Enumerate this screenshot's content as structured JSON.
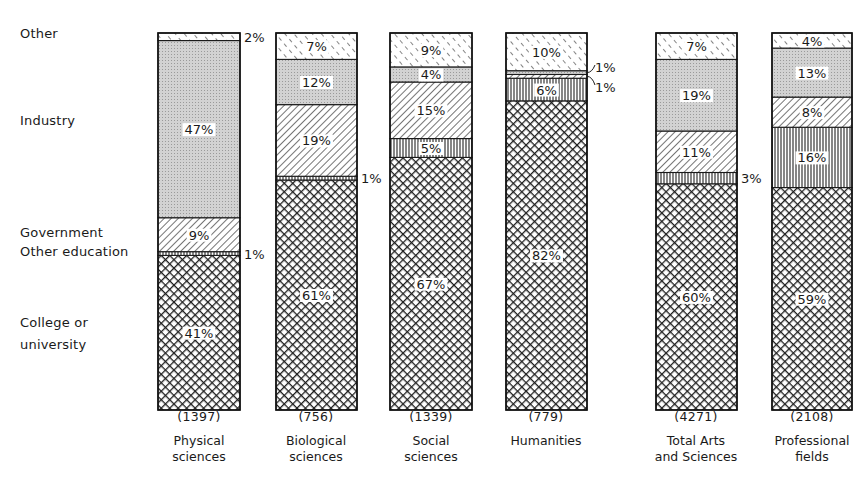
{
  "chart_data": {
    "type": "bar",
    "stacked": true,
    "orientation": "vertical",
    "title": "",
    "xlabel": "",
    "ylabel": "",
    "unit": "%",
    "ylim": [
      0,
      100
    ],
    "grid": false,
    "legend_position": "left (row labels aligned to segments of first bar)",
    "categories": [
      "Physical sciences",
      "Biological sciences",
      "Social sciences",
      "Humanities",
      "Total Arts and Sciences",
      "Professional fields"
    ],
    "sample_sizes": [
      1397,
      756,
      1339,
      779,
      4271,
      2108
    ],
    "series": [
      {
        "name": "College or university",
        "pattern": "crosshatch",
        "values": [
          41,
          61,
          67,
          82,
          60,
          59
        ]
      },
      {
        "name": "Other education",
        "pattern": "vertical-lines",
        "values": [
          1,
          1,
          5,
          6,
          3,
          16
        ]
      },
      {
        "name": "Government",
        "pattern": "diagonal-lines",
        "values": [
          9,
          19,
          15,
          1,
          11,
          8
        ]
      },
      {
        "name": "Industry",
        "pattern": "stipple",
        "values": [
          47,
          12,
          4,
          1,
          19,
          13
        ]
      },
      {
        "name": "Other",
        "pattern": "dashed-diagonal",
        "values": [
          2,
          7,
          9,
          10,
          7,
          4
        ]
      }
    ]
  },
  "legend": {
    "other": "Other",
    "industry": "Industry",
    "government": "Government",
    "other_education": "Other education",
    "college_line1": "College or",
    "college_line2": "university"
  },
  "bars": [
    {
      "count": "(1397)",
      "line1": "Physical",
      "line2": "sciences"
    },
    {
      "count": "(756)",
      "line1": "Biological",
      "line2": "sciences"
    },
    {
      "count": "(1339)",
      "line1": "Social",
      "line2": "sciences"
    },
    {
      "count": "(779)",
      "line1": "Humanities",
      "line2": ""
    },
    {
      "count": "(4271)",
      "line1": "Total Arts",
      "line2": "and Sciences"
    },
    {
      "count": "(2108)",
      "line1": "Professional",
      "line2": "fields"
    }
  ],
  "colors": {
    "ink": "#1a1a1a",
    "stipple": "#cfcfcf",
    "background": "#ffffff"
  }
}
